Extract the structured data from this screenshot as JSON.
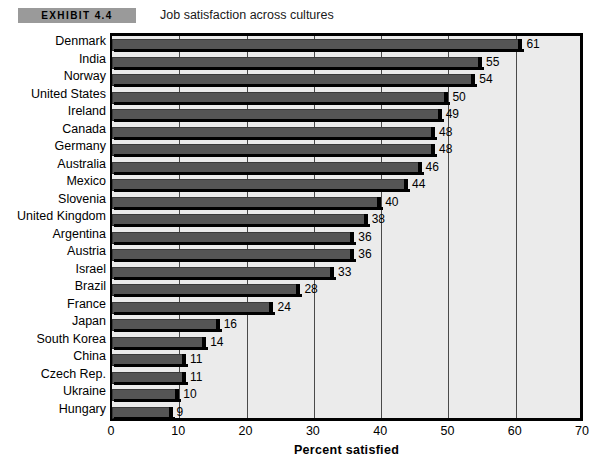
{
  "header": {
    "badge": "EXHIBIT 4.4",
    "caption": "Job satisfaction across cultures"
  },
  "chart_data": {
    "type": "bar",
    "orientation": "horizontal",
    "title": "Job satisfaction across cultures",
    "xlabel": "Percent satisfied",
    "ylabel": "",
    "xlim": [
      0,
      70
    ],
    "xticks": [
      0,
      10,
      20,
      30,
      40,
      50,
      60,
      70
    ],
    "grid": true,
    "legend": false,
    "categories": [
      "Denmark",
      "India",
      "Norway",
      "United States",
      "Ireland",
      "Canada",
      "Germany",
      "Australia",
      "Mexico",
      "Slovenia",
      "United Kingdom",
      "Argentina",
      "Austria",
      "Israel",
      "Brazil",
      "France",
      "Japan",
      "South Korea",
      "China",
      "Czech Rep.",
      "Ukraine",
      "Hungary"
    ],
    "values": [
      61,
      55,
      54,
      50,
      49,
      48,
      48,
      46,
      44,
      40,
      38,
      36,
      36,
      33,
      28,
      24,
      16,
      14,
      11,
      11,
      10,
      9
    ],
    "value_labels": [
      "61",
      "55",
      "54",
      "50",
      "49",
      "48",
      "48",
      "46",
      "44",
      "40",
      "38",
      "36",
      "36",
      "33",
      "28",
      "24",
      "16",
      "14",
      "11",
      "11",
      "10",
      "9"
    ],
    "colors": {
      "bar": "#555555",
      "bar_cap": "#000000",
      "plot_background": "#ebebeb",
      "gridline": "#4a4a4a",
      "axis": "#000000",
      "badge": "#9a9a9a"
    }
  }
}
